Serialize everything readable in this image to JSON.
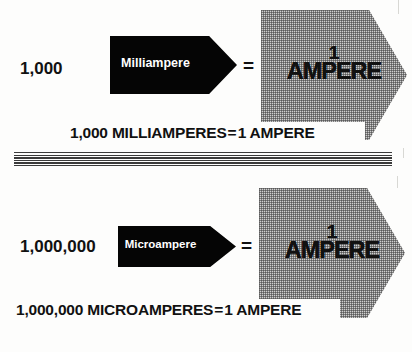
{
  "figure": {
    "background_color": "#fdfdfc",
    "ink_color": "#111111",
    "arrow_fill_color": "#050505",
    "block_fill_color": "#cfcfcf"
  },
  "rows": [
    {
      "id": "milliampere-row",
      "multiplier": "1,000",
      "arrow_label": "Milliampere",
      "equals_symbol": "=",
      "result_quantity": "1",
      "result_unit": "AMPERE",
      "caption": {
        "left": "1,000 MILLIAMPERES",
        "equals": "=",
        "right": "1 AMPERE",
        "full": "1,000 MILLIAMPERES = 1 AMPERE"
      }
    },
    {
      "id": "microampere-row",
      "multiplier": "1,000,000",
      "arrow_label": "Microampere",
      "equals_symbol": "=",
      "result_quantity": "1",
      "result_unit": "AMPERE",
      "caption": {
        "left": "1,000,000 MICROAMPERES",
        "equals": "=",
        "right": "1 AMPERE",
        "full": "1,000,000 MICROAMPERES = 1 AMPERE"
      }
    }
  ],
  "divider": {
    "name": "horizontal-rule-stack",
    "line_count": 6
  }
}
